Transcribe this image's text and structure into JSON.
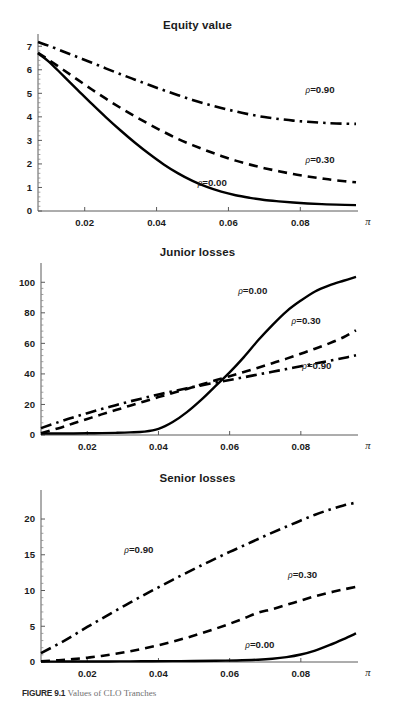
{
  "figure": {
    "caption_label": "FIGURE 9.1",
    "caption_text": "Values of CLO Tranches"
  },
  "chart_data": [
    {
      "type": "line",
      "title": "Equity value",
      "xlabel": "π",
      "ylabel": "",
      "xlim": [
        0.007,
        0.0955
      ],
      "ylim": [
        0,
        7.35
      ],
      "xticks": [
        0.02,
        0.04,
        0.06,
        0.08
      ],
      "xticklabels": [
        "0.02",
        "0.04",
        "0.06",
        "0.08"
      ],
      "yticks": [
        0,
        1,
        2,
        3,
        4,
        5,
        6,
        7
      ],
      "yticklabels": [
        "0",
        "1",
        "2",
        "3",
        "4",
        "5",
        "6",
        "7"
      ],
      "grid": false,
      "legend_position": "inline-right",
      "series": [
        {
          "name": "ρ=0.00",
          "label": "ρ=0.00",
          "dash": "solid",
          "label_x": 0.0555,
          "label_y": 1.05,
          "x": [
            0.007,
            0.01,
            0.014,
            0.018,
            0.022,
            0.026,
            0.03,
            0.034,
            0.038,
            0.042,
            0.046,
            0.05,
            0.054,
            0.058,
            0.062,
            0.066,
            0.07,
            0.074,
            0.078,
            0.082,
            0.086,
            0.09,
            0.0955
          ],
          "y": [
            6.7,
            6.35,
            5.75,
            5.15,
            4.55,
            3.97,
            3.42,
            2.9,
            2.42,
            1.98,
            1.6,
            1.28,
            1.02,
            0.82,
            0.67,
            0.56,
            0.47,
            0.41,
            0.36,
            0.32,
            0.29,
            0.27,
            0.25
          ]
        },
        {
          "name": "ρ=0.30",
          "label": "ρ=0.30",
          "dash": "dashed",
          "label_x": 0.0855,
          "label_y": 2.05,
          "x": [
            0.007,
            0.01,
            0.014,
            0.018,
            0.022,
            0.026,
            0.03,
            0.034,
            0.038,
            0.042,
            0.046,
            0.05,
            0.054,
            0.058,
            0.062,
            0.066,
            0.07,
            0.074,
            0.078,
            0.082,
            0.086,
            0.09,
            0.0955
          ],
          "y": [
            6.72,
            6.42,
            6.0,
            5.58,
            5.16,
            4.76,
            4.38,
            4.02,
            3.68,
            3.36,
            3.06,
            2.8,
            2.56,
            2.34,
            2.14,
            1.97,
            1.82,
            1.69,
            1.57,
            1.47,
            1.38,
            1.3,
            1.22
          ]
        },
        {
          "name": "ρ=0.90",
          "label": "ρ=0.90",
          "dash": "dashdot",
          "label_x": 0.0855,
          "label_y": 5.03,
          "x": [
            0.007,
            0.01,
            0.014,
            0.018,
            0.022,
            0.026,
            0.03,
            0.034,
            0.038,
            0.042,
            0.046,
            0.05,
            0.054,
            0.058,
            0.062,
            0.066,
            0.07,
            0.074,
            0.078,
            0.082,
            0.086,
            0.09,
            0.0955
          ],
          "y": [
            7.18,
            7.02,
            6.78,
            6.54,
            6.3,
            6.05,
            5.81,
            5.58,
            5.35,
            5.13,
            4.92,
            4.72,
            4.54,
            4.38,
            4.23,
            4.1,
            3.99,
            3.91,
            3.84,
            3.79,
            3.75,
            3.72,
            3.7
          ]
        }
      ]
    },
    {
      "type": "line",
      "title": "Junior losses",
      "xlabel": "π",
      "ylabel": "",
      "xlim": [
        0.007,
        0.0955
      ],
      "ylim": [
        0,
        110
      ],
      "xticks": [
        0.02,
        0.04,
        0.06,
        0.08
      ],
      "xticklabels": [
        "0.02",
        "0.04",
        "0.06",
        "0.08"
      ],
      "yticks": [
        0,
        20,
        40,
        60,
        80,
        100
      ],
      "yticklabels": [
        "0",
        "20",
        "40",
        "60",
        "80",
        "100"
      ],
      "grid": false,
      "legend_position": "inline-right",
      "series": [
        {
          "name": "ρ=0.00",
          "label": "ρ=0.00",
          "dash": "solid",
          "label_x": 0.0665,
          "label_y": 92,
          "x": [
            0.007,
            0.012,
            0.016,
            0.02,
            0.024,
            0.028,
            0.032,
            0.036,
            0.04,
            0.044,
            0.048,
            0.052,
            0.056,
            0.06,
            0.064,
            0.068,
            0.072,
            0.076,
            0.08,
            0.084,
            0.088,
            0.092,
            0.0955
          ],
          "y": [
            1.0,
            1.0,
            1.0,
            1.1,
            1.2,
            1.4,
            1.7,
            2.2,
            4.0,
            8.5,
            15.0,
            23.0,
            32.0,
            41.0,
            51.0,
            62.0,
            72.0,
            81.0,
            88.0,
            94.0,
            98.0,
            101.0,
            103.5
          ]
        },
        {
          "name": "ρ=0.30",
          "label": "ρ=0.30",
          "dash": "dashed",
          "label_x": 0.0815,
          "label_y": 73,
          "x": [
            0.007,
            0.012,
            0.016,
            0.02,
            0.024,
            0.028,
            0.032,
            0.036,
            0.04,
            0.044,
            0.048,
            0.052,
            0.056,
            0.06,
            0.064,
            0.068,
            0.072,
            0.076,
            0.08,
            0.084,
            0.088,
            0.092,
            0.0955
          ],
          "y": [
            1.2,
            4.5,
            7.5,
            10.5,
            13.5,
            16.3,
            19.2,
            22.0,
            24.8,
            27.5,
            30.2,
            33.0,
            35.8,
            38.5,
            41.2,
            44.0,
            47.0,
            50.0,
            53.2,
            56.5,
            60.0,
            64.0,
            68.5
          ]
        },
        {
          "name": "ρ=0.90",
          "label": "ρ=0.90",
          "dash": "dashdot",
          "label_x": 0.0845,
          "label_y": 43,
          "x": [
            0.007,
            0.012,
            0.016,
            0.02,
            0.024,
            0.028,
            0.032,
            0.036,
            0.04,
            0.044,
            0.048,
            0.052,
            0.056,
            0.06,
            0.064,
            0.068,
            0.072,
            0.076,
            0.08,
            0.084,
            0.088,
            0.092,
            0.0955
          ],
          "y": [
            4.5,
            8.5,
            11.5,
            14.3,
            17.0,
            19.5,
            22.0,
            24.3,
            26.5,
            28.6,
            30.6,
            32.5,
            34.3,
            36.0,
            37.8,
            39.6,
            41.4,
            43.2,
            45.0,
            46.8,
            48.6,
            50.4,
            52.2
          ]
        }
      ]
    },
    {
      "type": "line",
      "title": "Senior losses",
      "xlabel": "π",
      "ylabel": "",
      "xlim": [
        0.007,
        0.0955
      ],
      "ylim": [
        0,
        23.5
      ],
      "xticks": [
        0.02,
        0.04,
        0.06,
        0.08
      ],
      "xticklabels": [
        "0.02",
        "0.04",
        "0.06",
        "0.08"
      ],
      "yticks": [
        0,
        5,
        10,
        15,
        20
      ],
      "yticklabels": [
        "0",
        "5",
        "10",
        "15",
        "20"
      ],
      "grid": false,
      "legend_position": "inline-right",
      "series": [
        {
          "name": "ρ=0.00",
          "label": "ρ=0.00",
          "dash": "solid",
          "label_x": 0.0685,
          "label_y": 1.95,
          "x": [
            0.007,
            0.014,
            0.02,
            0.026,
            0.032,
            0.038,
            0.044,
            0.05,
            0.056,
            0.062,
            0.068,
            0.072,
            0.076,
            0.08,
            0.084,
            0.088,
            0.092,
            0.0955
          ],
          "y": [
            0.05,
            0.06,
            0.07,
            0.08,
            0.09,
            0.1,
            0.12,
            0.14,
            0.17,
            0.22,
            0.32,
            0.45,
            0.68,
            1.05,
            1.6,
            2.35,
            3.2,
            4.0
          ]
        },
        {
          "name": "ρ=0.30",
          "label": "ρ=0.30",
          "dash": "dashed",
          "label_x": 0.0805,
          "label_y": 11.8,
          "x": [
            0.007,
            0.012,
            0.016,
            0.02,
            0.024,
            0.028,
            0.032,
            0.036,
            0.04,
            0.044,
            0.048,
            0.052,
            0.056,
            0.06,
            0.064,
            0.068,
            0.072,
            0.076,
            0.08,
            0.084,
            0.088,
            0.092,
            0.0955
          ],
          "y": [
            0.1,
            0.25,
            0.4,
            0.6,
            0.85,
            1.15,
            1.5,
            1.9,
            2.35,
            2.85,
            3.4,
            4.0,
            4.65,
            5.35,
            6.1,
            6.9,
            7.4,
            8.0,
            8.6,
            9.2,
            9.7,
            10.15,
            10.5
          ]
        },
        {
          "name": "ρ=0.90",
          "label": "ρ=0.90",
          "dash": "dashdot",
          "label_x": 0.0345,
          "label_y": 15.3,
          "x": [
            0.007,
            0.012,
            0.016,
            0.02,
            0.024,
            0.028,
            0.032,
            0.036,
            0.04,
            0.044,
            0.048,
            0.052,
            0.056,
            0.06,
            0.064,
            0.068,
            0.072,
            0.076,
            0.08,
            0.084,
            0.088,
            0.092,
            0.0955
          ],
          "y": [
            1.25,
            2.55,
            3.7,
            4.9,
            6.05,
            7.2,
            8.3,
            9.4,
            10.45,
            11.5,
            12.5,
            13.5,
            14.45,
            15.4,
            16.3,
            17.2,
            18.1,
            18.95,
            19.8,
            20.6,
            21.3,
            21.9,
            22.3
          ]
        }
      ]
    }
  ]
}
